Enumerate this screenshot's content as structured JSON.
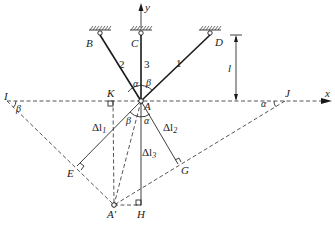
{
  "figure": {
    "type": "truss-displacement-diagram",
    "axes": {
      "x_label": "x",
      "y_label": "y"
    },
    "dimension": {
      "label": "l"
    },
    "supports": [
      {
        "id": "B",
        "label": "B"
      },
      {
        "id": "C",
        "label": "C"
      },
      {
        "id": "D",
        "label": "D"
      }
    ],
    "bars": [
      {
        "id": "1",
        "label": "1",
        "from": "A",
        "to": "D"
      },
      {
        "id": "2",
        "label": "2",
        "from": "A",
        "to": "B"
      },
      {
        "id": "3",
        "label": "3",
        "from": "A",
        "to": "C"
      }
    ],
    "points": {
      "A": "A",
      "A_prime": "A′",
      "I": "I",
      "J": "J",
      "K": "K",
      "E": "E",
      "G": "G",
      "H": "H"
    },
    "angles": {
      "alpha_top": "α",
      "beta_top": "β",
      "beta_I": "β",
      "alpha_J": "α",
      "beta_low": "β",
      "alpha_low": "α"
    },
    "elongations": {
      "dl1": "Δl",
      "dl1_sub": "1",
      "dl2": "Δl",
      "dl2_sub": "2",
      "dl3": "Δl",
      "dl3_sub": "3"
    }
  }
}
